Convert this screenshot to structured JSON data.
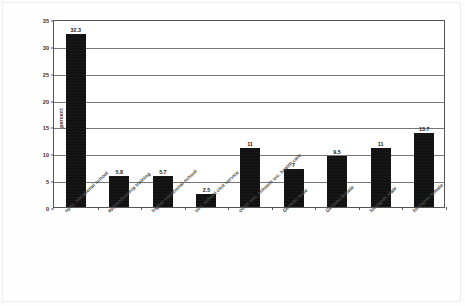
{
  "chart_data": {
    "type": "bar",
    "title": "",
    "xlabel": "",
    "ylabel": "percent",
    "ylim": [
      0,
      35
    ],
    "yticks": [
      0,
      5,
      10,
      15,
      20,
      25,
      30,
      35
    ],
    "grid": true,
    "legend": "none",
    "orientation": "vertical",
    "bar_color": "#111111",
    "categories": [
      "spec. vocational school",
      "apprenticeship training",
      "higher vocational school",
      "voc. school civil service",
      "other voc. schools inc. health care",
      "German male",
      "German female",
      "foreigner male",
      "foreigner female"
    ],
    "values": [
      32.3,
      5.8,
      5.7,
      2.5,
      11,
      7,
      9.5,
      11,
      13.7
    ],
    "value_labels": [
      "32.3",
      "5.8",
      "5.7",
      "2.5",
      "11",
      "7",
      "9.5",
      "11",
      "13.7"
    ]
  }
}
